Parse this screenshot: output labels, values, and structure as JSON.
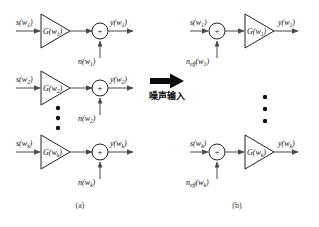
{
  "figure": {
    "type": "block-diagram",
    "panels": [
      {
        "id": "a",
        "caption": "(a)",
        "order": "amplifier-then-summer",
        "rows": [
          {
            "index": 1,
            "input_label": "s(w",
            "input_sub": "1",
            "input_close": ")",
            "gain_label": "G(w",
            "gain_sub": "1",
            "gain_close": ")",
            "noise_label": "n(w",
            "noise_sub": "1",
            "noise_close": ")",
            "output_label": "y(w",
            "output_sub": "1",
            "output_close": ")",
            "sum_symbol": "+"
          },
          {
            "index": 2,
            "input_label": "s(w",
            "input_sub": "2",
            "input_close": ")",
            "gain_label": "G(w",
            "gain_sub": "2",
            "gain_close": ")",
            "noise_label": "n(w",
            "noise_sub": "2",
            "noise_close": ")",
            "output_label": "y(w",
            "output_sub": "2",
            "output_close": ")",
            "sum_symbol": "+"
          },
          {
            "index": 3,
            "input_label": "s(w",
            "input_sub": "k",
            "input_close": ")",
            "gain_label": "G(w",
            "gain_sub": "k",
            "gain_close": ")",
            "noise_label": "n(w",
            "noise_sub": "k",
            "noise_close": ")",
            "output_label": "y(w",
            "output_sub": "k",
            "output_close": ")",
            "sum_symbol": "+"
          }
        ],
        "ellipsis_dots": 3
      },
      {
        "id": "b",
        "caption": "(b)",
        "order": "summer-then-amplifier",
        "rows": [
          {
            "index": 1,
            "input_label": "s(w",
            "input_sub": "1",
            "input_close": ")",
            "gain_label": "G(w",
            "gain_sub": "1",
            "gain_close": ")",
            "noise_label": "n",
            "noise_sub_eff": "eff",
            "noise_mid": "(w",
            "noise_sub": "1",
            "noise_close": ")",
            "output_label": "y(w",
            "output_sub": "1",
            "output_close": ")",
            "sum_symbol": "+"
          },
          {
            "index": 2,
            "input_label": "s(w",
            "input_sub": "k",
            "input_close": ")",
            "gain_label": "G(w",
            "gain_sub": "k",
            "gain_close": ")",
            "noise_label": "n",
            "noise_sub_eff": "eff",
            "noise_mid": "(w",
            "noise_sub": "k",
            "noise_close": ")",
            "output_label": "y(w",
            "output_sub": "k",
            "output_close": ")",
            "sum_symbol": "+"
          }
        ],
        "ellipsis_dots": 3
      }
    ],
    "transform": {
      "arrow_name": "right-arrow",
      "caption": "噪声输入"
    },
    "colors": {
      "wire": "#4a4a4a",
      "shape_outline": "#222222",
      "text": "#111111",
      "caption_text": "#3a3a3a",
      "arrow_fill": "#0d0d0d",
      "background": "#ffffff"
    }
  }
}
